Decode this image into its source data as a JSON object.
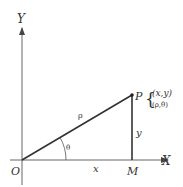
{
  "diagram": {
    "title": "",
    "axes": {
      "x_label": "X",
      "y_label": "Y",
      "origin_label": "O"
    },
    "points": {
      "P": {
        "label": "P",
        "cartesian": "(x,y)",
        "polar": "(ρ,θ)"
      },
      "M": {
        "label": "M"
      }
    },
    "segments": {
      "OP_label": "ρ",
      "OM_label": "x",
      "PM_label": "y"
    },
    "angle_label": "θ",
    "colors": {
      "line": "#333333",
      "axis": "#666666",
      "background": "#ffffff"
    }
  }
}
